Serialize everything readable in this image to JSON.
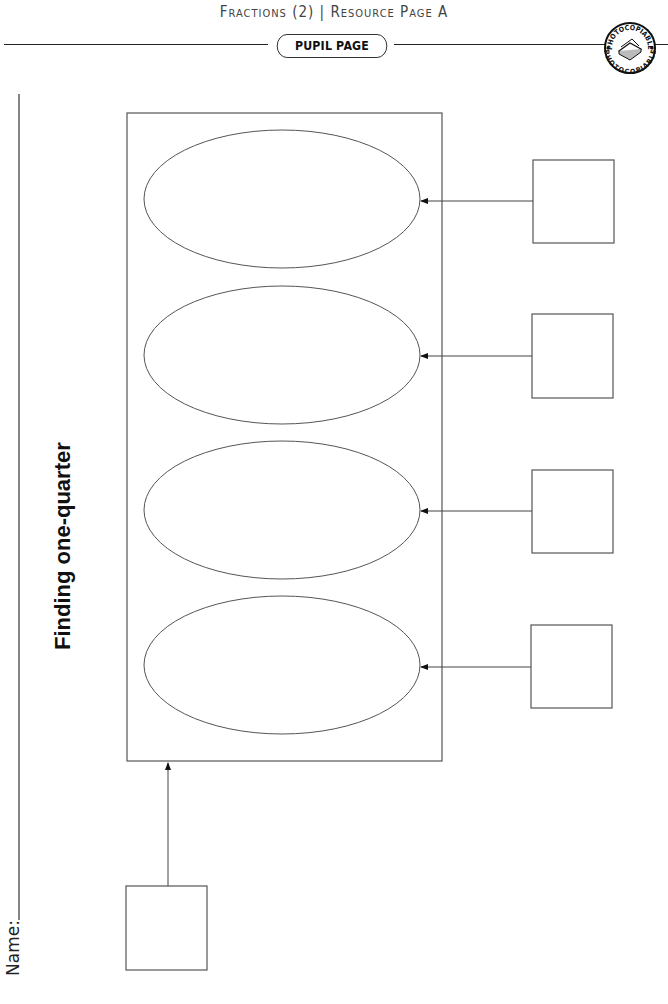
{
  "header": {
    "title": "Fractions (2) | Resource Page A",
    "pill_label": "PUPIL PAGE",
    "badge": {
      "icon": "photocopiable-stamp-icon",
      "text": "PHOTOCOPIABLE"
    }
  },
  "sheet": {
    "title": "Finding one-quarter",
    "name_label": "Name:"
  },
  "diagram": {
    "container": {
      "x": 127,
      "y": 113,
      "w": 315,
      "h": 648
    },
    "ellipses": [
      {
        "cx": 282,
        "cy": 199,
        "rx": 138,
        "ry": 69
      },
      {
        "cx": 282,
        "cy": 355,
        "rx": 138,
        "ry": 69
      },
      {
        "cx": 282,
        "cy": 510,
        "rx": 138,
        "ry": 69
      },
      {
        "cx": 282,
        "cy": 665,
        "rx": 138,
        "ry": 69
      }
    ],
    "answer_boxes": [
      {
        "x": 533,
        "y": 160,
        "w": 81,
        "h": 83
      },
      {
        "x": 532,
        "y": 314,
        "w": 81,
        "h": 84
      },
      {
        "x": 532,
        "y": 470,
        "w": 81,
        "h": 83
      },
      {
        "x": 531,
        "y": 625,
        "w": 81,
        "h": 83
      }
    ],
    "start_box": {
      "x": 126,
      "y": 886,
      "w": 81,
      "h": 84
    },
    "line_color": "#555555"
  }
}
